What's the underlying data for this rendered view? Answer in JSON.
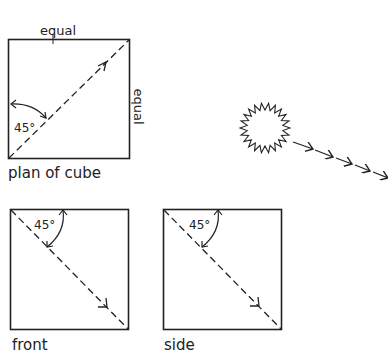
{
  "diagram": {
    "plan": {
      "label": "plan of cube",
      "top_label": "equal",
      "side_label": "equal",
      "angle_label": "45°"
    },
    "front": {
      "label": "front",
      "angle_label": "45°"
    },
    "side": {
      "label": "side",
      "angle_label": "45°"
    },
    "sun": {
      "rays": 5
    },
    "colors": {
      "ink": "#222222",
      "background": "#ffffff"
    }
  }
}
